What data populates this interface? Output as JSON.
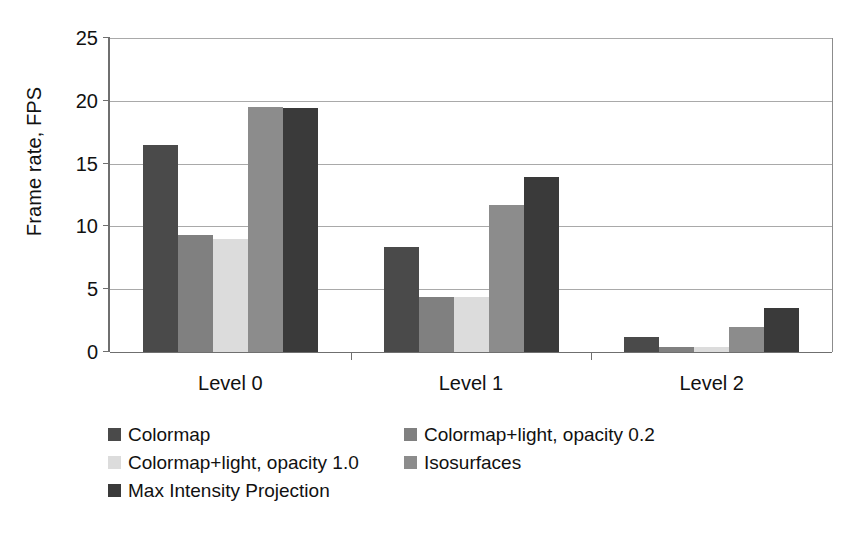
{
  "chart_data": {
    "type": "bar",
    "title": "",
    "subtitle": "",
    "xlabel": "",
    "ylabel": "Frame rate, FPS",
    "categories": [
      "Level 0",
      "Level 1",
      "Level 2"
    ],
    "ylim": [
      0,
      25
    ],
    "yticks": [
      0,
      5,
      10,
      15,
      20,
      25
    ],
    "ytick_labels": [
      "0",
      "5",
      "10",
      "15",
      "20",
      "25"
    ],
    "grid": true,
    "legend_position": "bottom",
    "series": [
      {
        "name": "Colormap",
        "color": "#4a4a4a",
        "values": [
          16.5,
          8.4,
          1.2
        ]
      },
      {
        "name": "Colormap+light, opacity 0.2",
        "color": "#808080",
        "values": [
          9.3,
          4.4,
          0.4
        ]
      },
      {
        "name": "Colormap+light, opacity 1.0",
        "color": "#dcdcdc",
        "values": [
          9.0,
          4.4,
          0.4
        ]
      },
      {
        "name": "Isosurfaces",
        "color": "#8c8c8c",
        "values": [
          19.5,
          11.7,
          2.0
        ]
      },
      {
        "name": "Max Intensity Projection",
        "color": "#3a3a3a",
        "values": [
          19.4,
          13.9,
          3.5
        ]
      }
    ]
  },
  "legend": {
    "entries": [
      {
        "label": "Colormap",
        "color": "#4a4a4a"
      },
      {
        "label": "Colormap+light, opacity 0.2",
        "color": "#808080"
      },
      {
        "label": "Colormap+light, opacity 1.0",
        "color": "#dcdcdc"
      },
      {
        "label": "Isosurfaces",
        "color": "#8c8c8c"
      },
      {
        "label": "Max Intensity Projection",
        "color": "#3a3a3a"
      }
    ]
  },
  "axis": {
    "y_title": "Frame rate, FPS"
  }
}
